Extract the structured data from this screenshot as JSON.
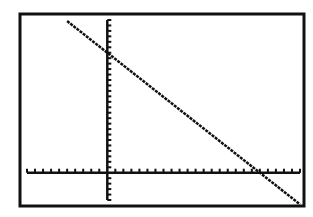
{
  "chart_data": {
    "type": "line",
    "title": "",
    "xlabel": "",
    "ylabel": "",
    "grid": false,
    "axes_ticks": true,
    "window": {
      "xmin": -10,
      "xmax": 24,
      "xscl": 1,
      "ymin": -5,
      "ymax": 28,
      "yscl": 1
    },
    "series": [
      {
        "name": "Y1",
        "equation": "y = -1.16x + 22",
        "x": [
          -5,
          0,
          19,
          24
        ],
        "y": [
          27.8,
          22,
          0,
          -5.8
        ]
      }
    ],
    "intercepts": {
      "y_intercept": 22,
      "x_intercept": 19
    }
  },
  "colors": {
    "background": "#ffffff",
    "frame": "#111111",
    "axes": "#111111",
    "line": "#111111"
  }
}
